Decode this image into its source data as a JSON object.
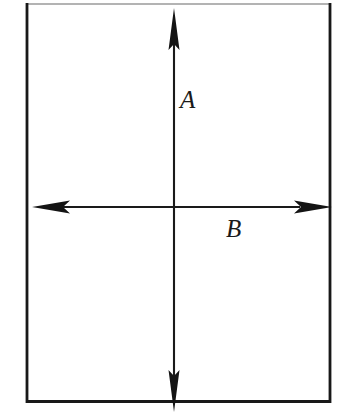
{
  "figure": {
    "background_color": "#ffffff",
    "stroke_color": "#1a1a1a",
    "frame": {
      "name": "figure-border",
      "left_px": 26,
      "right_px": 331,
      "top_px": 4,
      "bottom_px": 402,
      "top_border_color": "#8c8c8c",
      "side_border_color": "#181818",
      "bottom_border_color": "#181818",
      "top_border_width_px": 1,
      "side_border_width_px": 3,
      "bottom_border_width_px": 3
    },
    "axes": [
      {
        "id": "vertical-axis",
        "label": "A",
        "orientation": "vertical",
        "x_px": 174,
        "start_px": 8,
        "end_px": 412,
        "line_width_px": 2,
        "arrowheads": [
          "up",
          "down"
        ],
        "arrowhead_length_px": 42,
        "arrowhead_half_width_px": 6,
        "label_position": {
          "x_px": 180,
          "y_px": 87
        },
        "label_font_size_px": 25,
        "label_style": "italic-serif"
      },
      {
        "id": "horizontal-axis",
        "label": "B",
        "orientation": "horizontal",
        "y_px": 207,
        "start_px": 32,
        "end_px": 332,
        "line_width_px": 2,
        "arrowheads": [
          "left",
          "right"
        ],
        "arrowhead_length_px": 36,
        "arrowhead_half_width_px": 7,
        "label_position": {
          "x_px": 226,
          "y_px": 216
        },
        "label_font_size_px": 25,
        "label_style": "italic-serif"
      }
    ],
    "origin": {
      "x_px": 174,
      "y_px": 207
    },
    "labels": {
      "vertical": "A",
      "horizontal": "B"
    }
  }
}
